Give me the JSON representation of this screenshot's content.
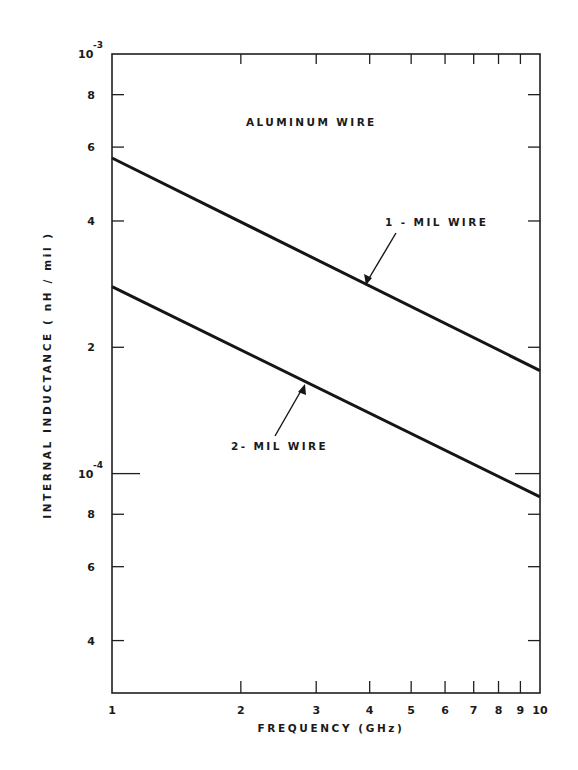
{
  "chart_data": {
    "type": "line",
    "title": "ALUMINUM WIRE",
    "xlabel": "FREQUENCY (GHz)",
    "ylabel": "INTERNAL INDUCTANCE (nH/mil)",
    "xscale": "log",
    "yscale": "log",
    "xlim": [
      1,
      10
    ],
    "ylim": [
      3e-05,
      0.001
    ],
    "grid": false,
    "legend": "none (inline annotations with arrows)",
    "x_ticks": [
      1,
      2,
      3,
      4,
      5,
      6,
      7,
      8,
      9,
      10
    ],
    "x_tick_labels": [
      "1",
      "2",
      "3",
      "4",
      "5",
      "6",
      "7",
      "8",
      "9",
      "10"
    ],
    "y_ticks": [
      0.001,
      0.0008,
      0.0006,
      0.0004,
      0.0002,
      0.0001,
      8e-05,
      6e-05,
      4e-05
    ],
    "y_tick_labels": [
      {
        "mantissa": "10",
        "exponent": "-3"
      },
      {
        "mantissa": "8",
        "exponent": ""
      },
      {
        "mantissa": "6",
        "exponent": ""
      },
      {
        "mantissa": "4",
        "exponent": ""
      },
      {
        "mantissa": "2",
        "exponent": ""
      },
      {
        "mantissa": "10",
        "exponent": "-4"
      },
      {
        "mantissa": "8",
        "exponent": ""
      },
      {
        "mantissa": "6",
        "exponent": ""
      },
      {
        "mantissa": "4",
        "exponent": ""
      }
    ],
    "x": [
      1,
      10
    ],
    "series": [
      {
        "name": "1- MIL WIRE",
        "values": [
          0.000565,
          0.000176
        ]
      },
      {
        "name": "2- MIL WIRE",
        "values": [
          0.000279,
          8.8e-05
        ]
      }
    ],
    "annotations": [
      {
        "text": "ALUMINUM WIRE",
        "x": 1.95,
        "y": 0.00071
      },
      {
        "text": "1- MIL WIRE",
        "x": 4.1,
        "y": 0.00039,
        "arrow_to": [
          3.9,
          0.000292
        ]
      },
      {
        "text": "2- MIL WIRE",
        "x": 2.1,
        "y": 0.000112,
        "arrow_to": [
          2.8,
          0.000175
        ]
      }
    ]
  },
  "labels": {
    "title": "ALUMINUM WIRE",
    "xlabel": "FREQUENCY  (GHz)",
    "ylabel": "INTERNAL  INDUCTANCE  ( nH / mil )",
    "series1": "1 - MIL  WIRE",
    "series2": "2-  MIL  WIRE"
  },
  "colors": {
    "ink": "#151515",
    "background": "#ffffff"
  }
}
